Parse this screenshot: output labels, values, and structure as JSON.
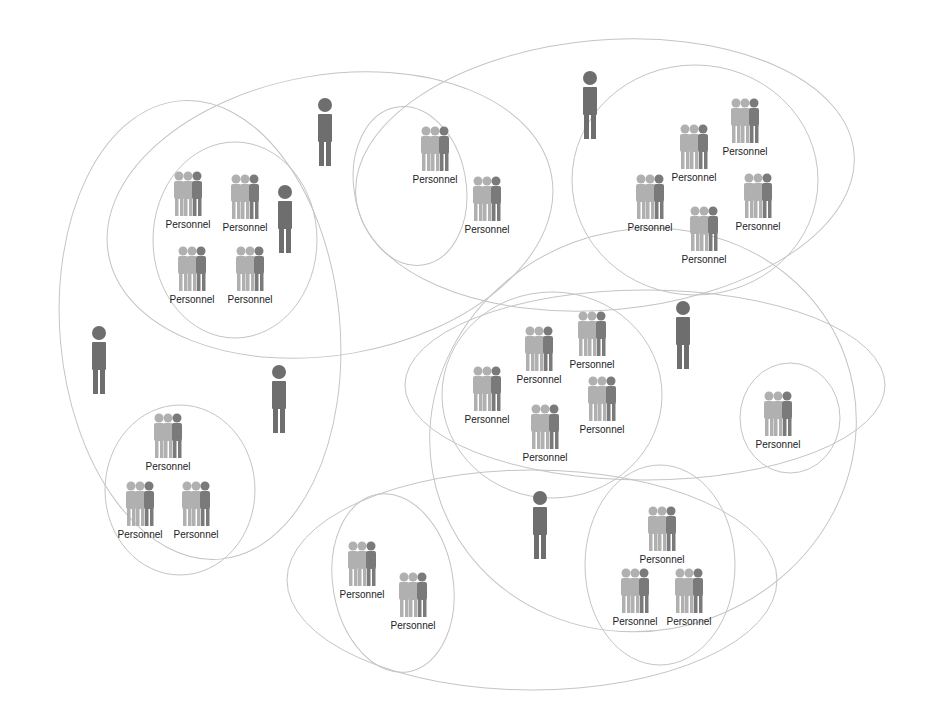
{
  "diagram": {
    "colors": {
      "outline": "#bdbdbd",
      "group_light": "#a9a9a9",
      "group_dark": "#777777",
      "person": "#6e6e6e"
    },
    "group_label": "Personnel",
    "ellipses": [
      {
        "cx": 330,
        "cy": 215,
        "rx": 225,
        "ry": 140,
        "rot": -10
      },
      {
        "cx": 200,
        "cy": 330,
        "rx": 140,
        "ry": 230,
        "rot": -5
      },
      {
        "cx": 235,
        "cy": 240,
        "rx": 82,
        "ry": 98,
        "rot": 0
      },
      {
        "cx": 410,
        "cy": 186,
        "rx": 56,
        "ry": 80,
        "rot": -10
      },
      {
        "cx": 605,
        "cy": 175,
        "rx": 250,
        "ry": 135,
        "rot": -5
      },
      {
        "cx": 695,
        "cy": 180,
        "rx": 123,
        "ry": 115,
        "rot": 0
      },
      {
        "cx": 645,
        "cy": 385,
        "rx": 240,
        "ry": 95,
        "rot": 0
      },
      {
        "cx": 643,
        "cy": 430,
        "rx": 215,
        "ry": 200,
        "rot": -20
      },
      {
        "cx": 552,
        "cy": 395,
        "rx": 110,
        "ry": 103,
        "rot": 0
      },
      {
        "cx": 790,
        "cy": 418,
        "rx": 50,
        "ry": 55,
        "rot": 0
      },
      {
        "cx": 532,
        "cy": 580,
        "rx": 245,
        "ry": 110,
        "rot": 0
      },
      {
        "cx": 393,
        "cy": 583,
        "rx": 60,
        "ry": 90,
        "rot": -10
      },
      {
        "cx": 660,
        "cy": 565,
        "rx": 75,
        "ry": 100,
        "rot": 0
      },
      {
        "cx": 180,
        "cy": 490,
        "rx": 75,
        "ry": 85,
        "rot": 0
      }
    ],
    "groups": [
      {
        "x": 188,
        "y": 195
      },
      {
        "x": 245,
        "y": 198
      },
      {
        "x": 192,
        "y": 270
      },
      {
        "x": 250,
        "y": 270
      },
      {
        "x": 435,
        "y": 150
      },
      {
        "x": 487,
        "y": 200
      },
      {
        "x": 745,
        "y": 122
      },
      {
        "x": 694,
        "y": 148
      },
      {
        "x": 650,
        "y": 198
      },
      {
        "x": 758,
        "y": 197
      },
      {
        "x": 704,
        "y": 230
      },
      {
        "x": 539,
        "y": 350
      },
      {
        "x": 592,
        "y": 335
      },
      {
        "x": 487,
        "y": 390
      },
      {
        "x": 602,
        "y": 400
      },
      {
        "x": 545,
        "y": 428
      },
      {
        "x": 778,
        "y": 415
      },
      {
        "x": 168,
        "y": 437
      },
      {
        "x": 140,
        "y": 505
      },
      {
        "x": 196,
        "y": 505
      },
      {
        "x": 362,
        "y": 565
      },
      {
        "x": 413,
        "y": 596
      },
      {
        "x": 662,
        "y": 530
      },
      {
        "x": 635,
        "y": 592
      },
      {
        "x": 689,
        "y": 592
      }
    ],
    "persons": [
      {
        "x": 325,
        "y": 105
      },
      {
        "x": 590,
        "y": 78
      },
      {
        "x": 285,
        "y": 192
      },
      {
        "x": 99,
        "y": 333
      },
      {
        "x": 279,
        "y": 372
      },
      {
        "x": 683,
        "y": 308
      },
      {
        "x": 540,
        "y": 498
      }
    ]
  }
}
